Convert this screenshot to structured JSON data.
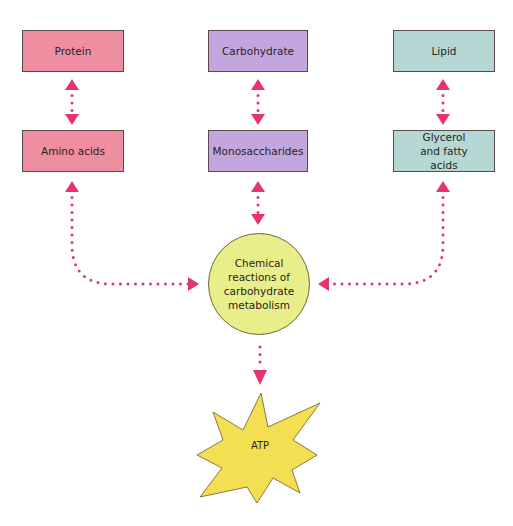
{
  "diagram": {
    "colors": {
      "protein_branch": "#ef8ea0",
      "carbohydrate_branch": "#c4a6de",
      "lipid_branch": "#b6d8d4",
      "metabolism_circle": "#e8ef8a",
      "atp_star": "#f4de52",
      "arrows": "#e8336f"
    },
    "columns": [
      {
        "macronutrient": "Protein",
        "breakdown_product": "Amino acids"
      },
      {
        "macronutrient": "Carbohydrate",
        "breakdown_product": "Monosaccharides"
      },
      {
        "macronutrient": "Lipid",
        "breakdown_product": "Glycerol and fatty acids"
      }
    ],
    "center": {
      "label": "Chemical reactions of carbohydrate metabolism"
    },
    "output": {
      "label": "ATP"
    },
    "edges": [
      {
        "from": "Protein",
        "to": "Amino acids",
        "style": "dotted",
        "direction": "bidirectional"
      },
      {
        "from": "Carbohydrate",
        "to": "Monosaccharides",
        "style": "dotted",
        "direction": "bidirectional"
      },
      {
        "from": "Lipid",
        "to": "Glycerol and fatty acids",
        "style": "dotted",
        "direction": "bidirectional"
      },
      {
        "from": "Amino acids",
        "to": "Chemical reactions of carbohydrate metabolism",
        "style": "dotted",
        "direction": "bidirectional"
      },
      {
        "from": "Monosaccharides",
        "to": "Chemical reactions of carbohydrate metabolism",
        "style": "dotted",
        "direction": "bidirectional"
      },
      {
        "from": "Glycerol and fatty acids",
        "to": "Chemical reactions of carbohydrate metabolism",
        "style": "dotted",
        "direction": "bidirectional"
      },
      {
        "from": "Chemical reactions of carbohydrate metabolism",
        "to": "ATP",
        "style": "dotted",
        "direction": "forward"
      }
    ]
  }
}
